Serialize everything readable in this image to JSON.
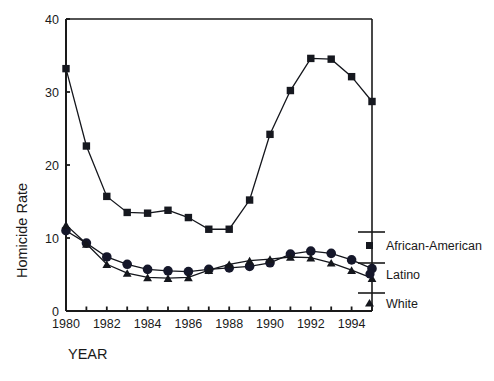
{
  "chart_data": {
    "type": "line",
    "title": "",
    "xlabel": "YEAR",
    "ylabel": "Homicide Rate",
    "xlim": [
      1980,
      1995
    ],
    "ylim": [
      0,
      40
    ],
    "xticks": [
      1980,
      1981,
      1982,
      1983,
      1984,
      1985,
      1986,
      1987,
      1988,
      1989,
      1990,
      1991,
      1992,
      1993,
      1994,
      1995
    ],
    "xtick_labels": [
      "1980",
      "",
      "1982",
      "",
      "1984",
      "",
      "1986",
      "",
      "1988",
      "",
      "1990",
      "",
      "1992",
      "",
      "1994",
      ""
    ],
    "yticks": [
      0,
      10,
      20,
      30,
      40
    ],
    "ytick_labels": [
      "0",
      "10",
      "20",
      "30",
      "40"
    ],
    "grid": false,
    "legend_position": "right",
    "x": [
      1980,
      1981,
      1982,
      1983,
      1984,
      1985,
      1986,
      1987,
      1988,
      1989,
      1990,
      1991,
      1992,
      1993,
      1994,
      1995
    ],
    "series": [
      {
        "name": "African-American",
        "marker": "square",
        "color": "#16181f",
        "values": [
          33.2,
          22.6,
          15.7,
          13.5,
          13.4,
          13.8,
          12.8,
          11.2,
          11.2,
          15.2,
          24.2,
          30.2,
          34.6,
          34.5,
          32.1,
          28.7
        ]
      },
      {
        "name": "Latino",
        "marker": "circle",
        "color": "#15172a",
        "values": [
          11.0,
          9.3,
          7.4,
          6.4,
          5.7,
          5.5,
          5.4,
          5.7,
          5.9,
          6.1,
          6.6,
          7.8,
          8.2,
          7.9,
          7.0,
          5.8
        ]
      },
      {
        "name": "White",
        "marker": "triangle",
        "color": "#14161c",
        "values": [
          11.8,
          9.2,
          6.4,
          5.2,
          4.6,
          4.5,
          4.6,
          5.6,
          6.4,
          6.9,
          7.1,
          7.4,
          7.3,
          6.6,
          5.6,
          4.5
        ]
      }
    ]
  },
  "legend": {
    "entries": [
      {
        "label": "African-American",
        "marker": "square"
      },
      {
        "label": "Latino",
        "marker": "circle"
      },
      {
        "label": "White",
        "marker": "triangle"
      }
    ]
  },
  "axes": {
    "y_title": "Homicide Rate",
    "x_title": "YEAR"
  }
}
